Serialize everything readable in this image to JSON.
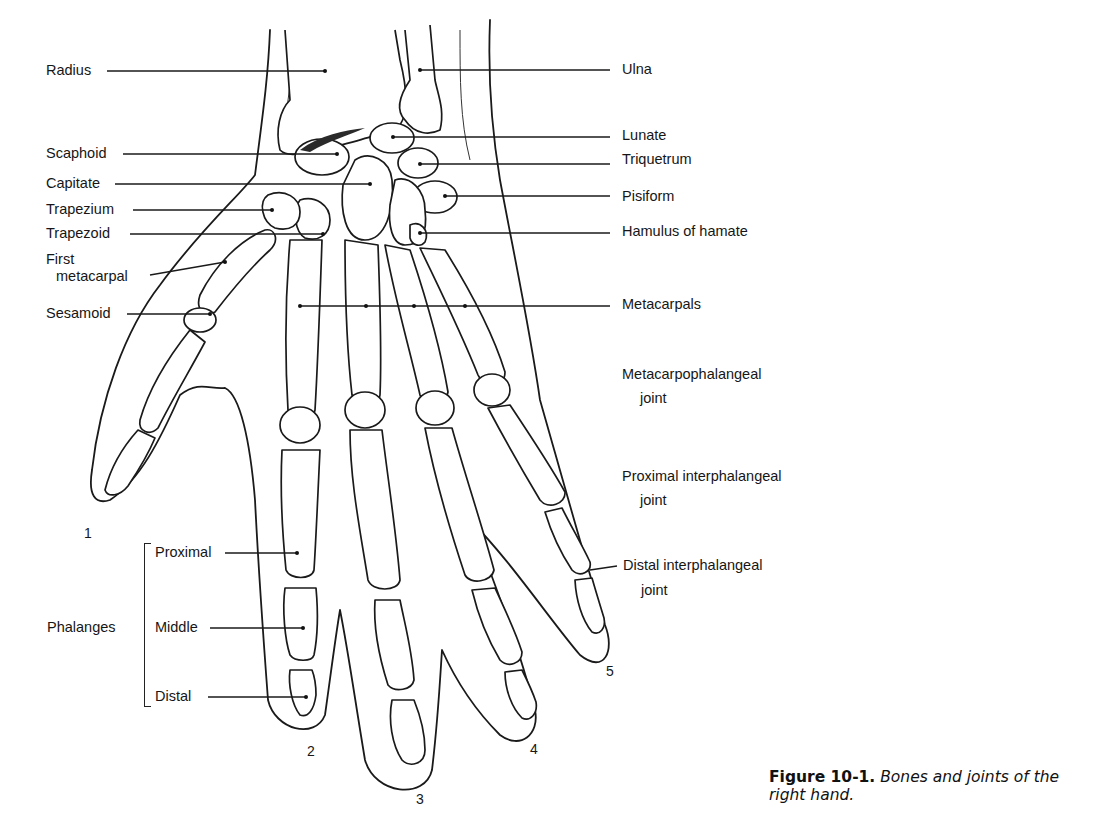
{
  "figure": {
    "number": "Figure 10-1.",
    "caption_text": "Bones and joints of the right hand.",
    "caption_line1": "Bones and joints of the",
    "caption_line2": "right hand."
  },
  "labels_left": {
    "radius": "Radius",
    "scaphoid": "Scaphoid",
    "capitate": "Capitate",
    "trapezium": "Trapezium",
    "trapezoid": "Trapezoid",
    "first_metacarpal_line1": "First",
    "first_metacarpal_line2": "metacarpal",
    "sesamoid": "Sesamoid"
  },
  "labels_right": {
    "ulna": "Ulna",
    "lunate": "Lunate",
    "triquetrum": "Triquetrum",
    "pisiform": "Pisiform",
    "hamulus_of_hamate": "Hamulus of hamate",
    "metacarpals": "Metacarpals",
    "mcp_joint_line1": "Metacarpophalangeal",
    "mcp_joint_line2": "joint",
    "pip_joint_line1": "Proximal interphalangeal",
    "pip_joint_line2": "joint",
    "dip_joint_line1": "Distal interphalangeal",
    "dip_joint_line2": "joint"
  },
  "phalanges": {
    "group_label": "Phalanges",
    "proximal": "Proximal",
    "middle": "Middle",
    "distal": "Distal"
  },
  "digit_numbers": {
    "thumb": "1",
    "index": "2",
    "middle": "3",
    "ring": "4",
    "little": "5"
  }
}
